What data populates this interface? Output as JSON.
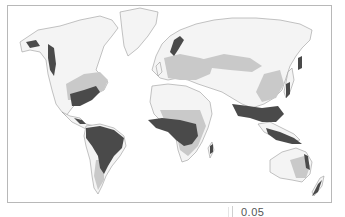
{
  "figure": {
    "type": "world-map",
    "legend_shades": {
      "dark_zone": "#4a4a4a",
      "medium_zone": "#c9c9c9",
      "light_zone": "#e9e9e9",
      "land_outline": "#9a9a9a",
      "background": "#ffffff"
    }
  },
  "footer": {
    "partial_label": "0.05"
  }
}
